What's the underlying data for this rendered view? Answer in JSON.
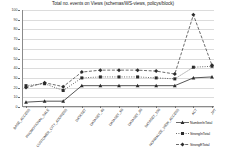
{
  "chart_data": {
    "type": "line",
    "title": "Total no. events on Views (schemas/WS-views, policys/block)",
    "xlabel": "",
    "ylabel": "",
    "ylim": [
      0,
      100
    ],
    "yticks": [
      0,
      10,
      20,
      30,
      40,
      50,
      60,
      70,
      80,
      90,
      100
    ],
    "grid": true,
    "legend_position": "bottom-right",
    "categories": [
      "BASE_ACCESS",
      "PROMOTIONAL_SALE",
      "CUSTOMER_CITY_ADDRESS",
      "DATASET",
      "DATASET_40",
      "DATASET_60",
      "DATASET_80",
      "DATASET_100",
      "NORMALIZE_VIEW_ACCESS",
      "ACT",
      "JPT"
    ],
    "series": [
      {
        "name": "NumberInTotal",
        "values": [
          5,
          6,
          6,
          22,
          22,
          22,
          22,
          22,
          22,
          30,
          31
        ],
        "marker": "triangle",
        "line": "solid"
      },
      {
        "name": "StrongInTotal",
        "values": [
          22,
          24,
          17,
          30,
          31,
          31,
          31,
          30,
          29,
          41,
          42
        ],
        "marker": "square",
        "line": "dotted"
      },
      {
        "name": "StrongETotal",
        "values": [
          20,
          25,
          21,
          36,
          38,
          38,
          38,
          37,
          34,
          95,
          43
        ],
        "marker": "diamond",
        "line": "dashed"
      }
    ]
  },
  "colors": {
    "axis": "#8a8a8a",
    "grid": "#dcdcdc",
    "series": "#2b2b2b",
    "text": "#1d1d1d"
  }
}
